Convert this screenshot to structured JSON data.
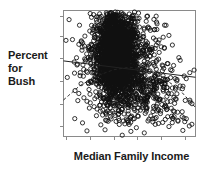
{
  "figure": {
    "background": "#ffffff",
    "frame_color": "#8a8a8a",
    "marker_color": "#111111",
    "line_color": "#222222"
  },
  "labels": {
    "ylabel_line1": "Percent",
    "ylabel_line2": "for",
    "ylabel_line3": "Bush",
    "xlabel": "Median Family Income"
  },
  "chart_data": {
    "type": "scatter",
    "title": "",
    "xlabel": "Median Family Income",
    "ylabel": "Percent for Bush",
    "xlim": [
      0,
      100
    ],
    "ylim": [
      0,
      100
    ],
    "grid": false,
    "legend": null,
    "x_tick_labels": [],
    "y_tick_labels": [],
    "x_tick_positions": [
      2,
      20,
      38,
      56,
      74,
      92
    ],
    "y_tick_positions": [
      8,
      26,
      44,
      62,
      80,
      96
    ],
    "marker": "open-circle",
    "marker_size": 2.1,
    "n_points": 3100,
    "cluster": {
      "note": "dense teardrop-shaped core left of center with diffuse tail to lower-right",
      "core_center_x": 40,
      "core_center_y": 66,
      "core_sd_x": 7,
      "core_sd_y": 16,
      "core_n": 2050,
      "halo_center_x": 44,
      "halo_center_y": 60,
      "halo_sd_x": 16,
      "halo_sd_y": 20,
      "halo_n": 700,
      "tail_center_x": 58,
      "tail_center_y": 32,
      "tail_sd_x": 19,
      "tail_sd_y": 16,
      "tail_n": 350
    },
    "series": [
      {
        "name": "linear-fit",
        "style": "solid",
        "type": "line",
        "x": [
          0,
          100
        ],
        "y": [
          60,
          47
        ]
      },
      {
        "name": "quadratic-fit",
        "style": "dashed",
        "type": "curve",
        "x": [
          0,
          12,
          25,
          38,
          50,
          62,
          75,
          88,
          100
        ],
        "y": [
          29,
          40,
          48,
          53,
          55,
          53,
          47,
          37,
          23
        ]
      }
    ]
  }
}
